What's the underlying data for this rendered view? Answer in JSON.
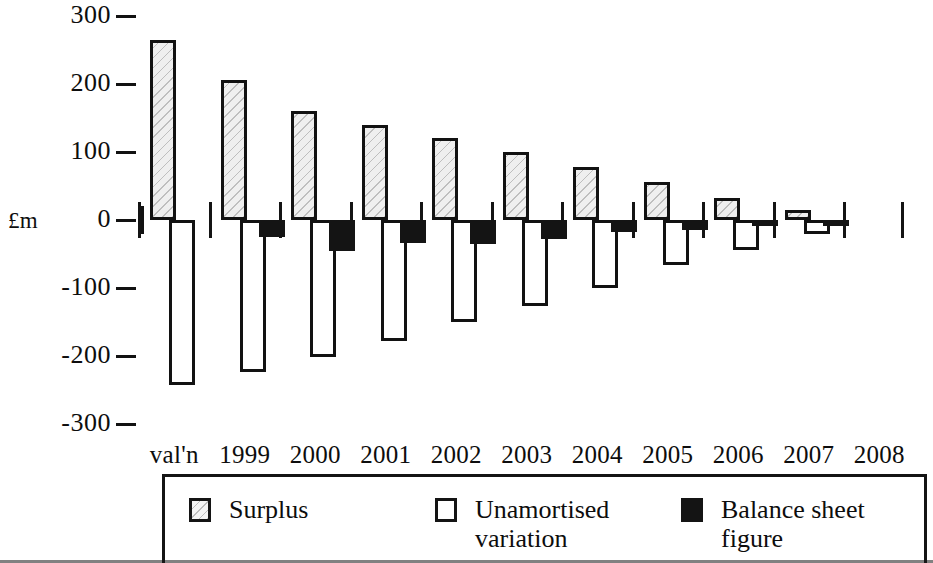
{
  "axis": {
    "y_label": "£m",
    "y_ticks": [
      "300",
      "200",
      "100",
      "0",
      "-100",
      "-200",
      "-300"
    ],
    "y_tick_values": [
      300,
      200,
      100,
      0,
      -100,
      -200,
      -300
    ],
    "x_labels": [
      "val'n",
      "1999",
      "2000",
      "2001",
      "2002",
      "2003",
      "2004",
      "2005",
      "2006",
      "2007",
      "2008"
    ]
  },
  "legend": {
    "items": [
      {
        "key": "surplus",
        "label": "Surplus"
      },
      {
        "key": "unamortised_variation",
        "label": "Unamortised\nvariation"
      },
      {
        "key": "balance_sheet_figure",
        "label": "Balance sheet\nfigure"
      }
    ]
  },
  "colors": {
    "surplus_fill": "#efefef",
    "unamortised_fill": "#ffffff",
    "balance_sheet_fill": "#141414",
    "outline": "#121212",
    "text": "#0d0d0d"
  },
  "chart_data": {
    "type": "bar",
    "title": "",
    "xlabel": "",
    "ylabel": "£m",
    "ylim": [
      -300,
      300
    ],
    "grid": false,
    "legend_position": "bottom",
    "categories": [
      "val'n",
      "1999",
      "2000",
      "2001",
      "2002",
      "2003",
      "2004",
      "2005",
      "2006",
      "2007",
      "2008"
    ],
    "series": [
      {
        "name": "Surplus",
        "values": [
          264,
          206,
          160,
          140,
          120,
          100,
          78,
          56,
          32,
          14,
          0
        ]
      },
      {
        "name": "Unamortised variation",
        "values": [
          -243,
          -224,
          -202,
          -178,
          -150,
          -126,
          -100,
          -66,
          -44,
          -20,
          0
        ]
      },
      {
        "name": "Balance sheet figure",
        "values": [
          0,
          -25,
          -45,
          -34,
          -36,
          -28,
          -18,
          -14,
          -9,
          -4,
          0
        ]
      }
    ]
  }
}
